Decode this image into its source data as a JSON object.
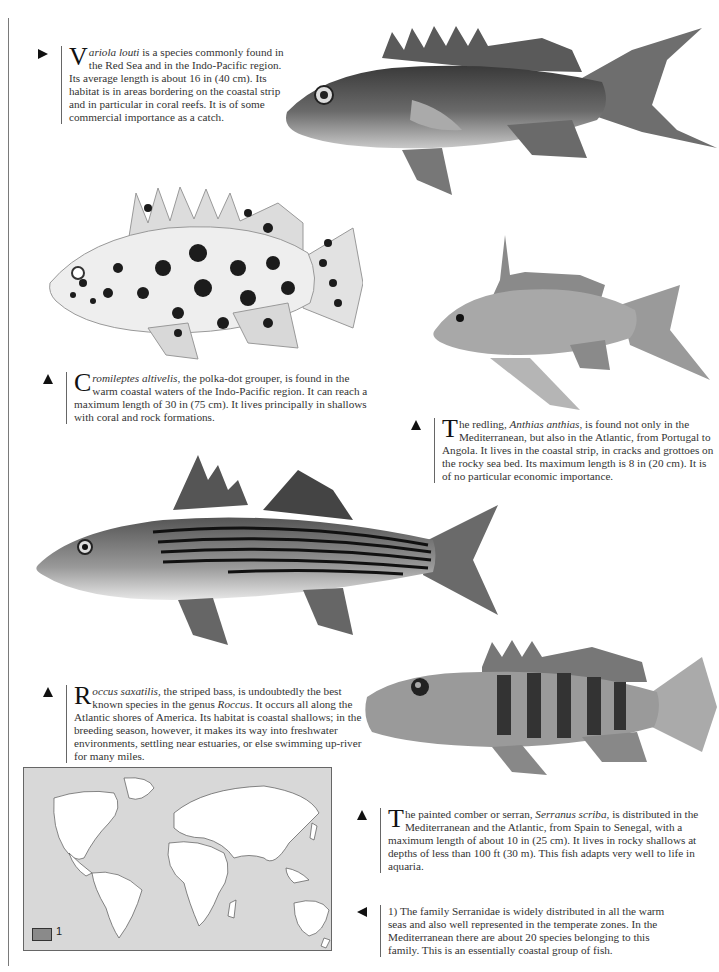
{
  "captions": [
    {
      "id": "variola",
      "marker": "right",
      "dropcap": "V",
      "species": "ariola louti",
      "text": " is a species commonly found in the Red Sea and in the Indo-Pacific region. Its average length is about 16 in (40 cm). Its habitat is in areas bordering on the coastal strip and in particular in coral reefs. It is of some commercial importance as a catch."
    },
    {
      "id": "cromileptes",
      "marker": "up",
      "dropcap": "C",
      "species": "romileptes altivelis",
      "text": ", the polka-dot grouper, is found in the warm coastal waters of the Indo-Pacific region. It can reach a maximum length of 30 in (75 cm). It lives principally in shallows with coral and rock formations."
    },
    {
      "id": "anthias",
      "marker": "up",
      "dropcap": "T",
      "pre": "he redling, ",
      "species": "Anthias anthias",
      "text": ", is found not only in the Mediterranean, but also in the Atlantic, from Portugal to Angola. It lives in the coastal strip, in cracks and grottoes on the rocky sea bed. Its maximum length is 8 in (20 cm). It is of no particular economic importance."
    },
    {
      "id": "roccus",
      "marker": "up",
      "dropcap": "R",
      "species": "occus saxatilis",
      "mid": ", the striped bass, is undoubtedly the best known species in the genus ",
      "genus": "Roccus",
      "text": ". It occurs all along the Atlantic shores of America. Its habitat is coastal shallows; in the breeding season, however, it makes its way into freshwater environments, settling near estuaries, or else swimming up-river for many miles."
    },
    {
      "id": "serranus",
      "marker": "up",
      "dropcap": "T",
      "pre": "he painted comber or serran, ",
      "species": "Serranus scriba",
      "text": ", is distributed in the Mediterranean and the Atlantic, from Spain to Senegal, with a maximum length of about 10 in (25 cm). It lives in rocky shallows at depths of less than 100 ft (30 m). This fish adapts very well to life in aquaria."
    },
    {
      "id": "family-note",
      "marker": "left",
      "text": "1) The family Serranidae is widely distributed in all the warm seas and also well represented in the temperate zones. In the Mediterranean there are about 20 species belonging to this family. This is an essentially coastal group of fish."
    }
  ],
  "illustrations": [
    {
      "id": "variola-louti",
      "label": "Variola louti illustration"
    },
    {
      "id": "cromileptes-altivelis",
      "label": "Cromileptes altivelis illustration"
    },
    {
      "id": "anthias-anthias",
      "label": "Anthias anthias illustration"
    },
    {
      "id": "roccus-saxatilis",
      "label": "Roccus saxatilis illustration"
    },
    {
      "id": "serranus-scriba",
      "label": "Serranus scriba illustration"
    }
  ],
  "map": {
    "legend_label": "1",
    "colors": {
      "ocean": "#d8d8d8",
      "land": "#ffffff",
      "range": "#8a8a8a"
    }
  }
}
